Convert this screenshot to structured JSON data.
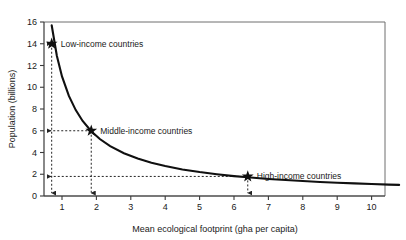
{
  "chart_data": {
    "type": "line",
    "title": "",
    "xlabel": "Mean ecological footprint (gha per capita)",
    "ylabel": "Population (billions)",
    "xlim": [
      0,
      10.8
    ],
    "ylim": [
      0,
      16
    ],
    "grid": false,
    "legend": "none",
    "curve_relation": "Population = 11 / footprint",
    "x": [
      0.62,
      0.7,
      0.85,
      1.0,
      1.2,
      1.4,
      1.6,
      1.85,
      2.1,
      2.4,
      2.8,
      3.2,
      3.6,
      4.0,
      4.5,
      5.0,
      5.5,
      6.0,
      6.4,
      7.0,
      7.5,
      8.0,
      8.5,
      9.0,
      9.5,
      10.0,
      10.5,
      10.8
    ],
    "y": [
      17.7,
      15.7,
      12.9,
      11.0,
      9.2,
      7.9,
      6.9,
      5.95,
      5.24,
      4.58,
      3.93,
      3.44,
      3.06,
      2.75,
      2.44,
      2.2,
      2.0,
      1.83,
      1.72,
      1.57,
      1.47,
      1.38,
      1.29,
      1.22,
      1.16,
      1.1,
      1.05,
      1.02
    ],
    "xticks": [
      1,
      2,
      3,
      4,
      5,
      6,
      7,
      8,
      9,
      10
    ],
    "yticks": [
      0,
      2,
      4,
      6,
      8,
      10,
      12,
      14,
      16
    ],
    "annotations": [
      {
        "id": "low-income",
        "label": "Low-income countries",
        "x": 0.7,
        "y": 14,
        "marker": "star",
        "guide_to_y_axis": true,
        "guide_to_x_axis": true
      },
      {
        "id": "middle-income",
        "label": "Middle-income countries",
        "x": 1.85,
        "y": 6,
        "marker": "star",
        "guide_to_y_axis": true,
        "guide_to_x_axis": true
      },
      {
        "id": "high-income",
        "label": "High-income countries",
        "x": 6.4,
        "y": 1.8,
        "marker": "star",
        "guide_to_y_axis": true,
        "guide_to_x_axis": true
      }
    ],
    "colors": {
      "curve": "#101010",
      "marker": "#101010",
      "guide": "#242424",
      "axis": "#3a3a3a",
      "frame": "#6e6e6e",
      "text": "#1a1a1a",
      "background": "#ffffff"
    }
  }
}
